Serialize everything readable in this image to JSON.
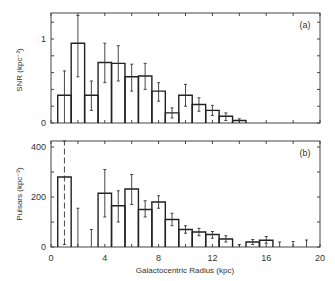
{
  "chart_data": [
    {
      "type": "bar",
      "panel_label": "(a)",
      "title": "",
      "xlabel": "Galactocentric Radius (kpc)",
      "ylabel": "SNR (kpc⁻²)",
      "xlim": [
        0,
        20
      ],
      "ylim": [
        0,
        1.3
      ],
      "yticks": [
        0,
        1
      ],
      "ytick_labels": [
        "0",
        "1"
      ],
      "bin_width": 1,
      "bin_centers": [
        1,
        2,
        3,
        4,
        5,
        6,
        7,
        8,
        9,
        10,
        11,
        12,
        13,
        14
      ],
      "values": [
        0.33,
        0.95,
        0.33,
        0.72,
        0.71,
        0.55,
        0.56,
        0.38,
        0.12,
        0.33,
        0.22,
        0.15,
        0.08,
        0.03
      ],
      "err_low": [
        0.0,
        0.55,
        0.15,
        0.48,
        0.5,
        0.38,
        0.4,
        0.26,
        0.06,
        0.2,
        0.14,
        0.09,
        0.03,
        0.0
      ],
      "err_high": [
        0.62,
        1.28,
        0.5,
        0.95,
        0.92,
        0.7,
        0.71,
        0.48,
        0.18,
        0.46,
        0.3,
        0.21,
        0.12,
        0.05
      ],
      "grid": false
    },
    {
      "type": "bar",
      "panel_label": "(b)",
      "title": "",
      "xlabel": "Galactocentric Radius (kpc)",
      "ylabel": "Pulsars (kpc⁻²)",
      "xlim": [
        0,
        20
      ],
      "ylim": [
        0,
        430
      ],
      "xticks": [
        0,
        4,
        8,
        12,
        16,
        20
      ],
      "xtick_labels": [
        "0",
        "4",
        "8",
        "12",
        "16",
        "20"
      ],
      "yticks": [
        0,
        200,
        400
      ],
      "ytick_labels": [
        "0",
        "200",
        "400"
      ],
      "bin_width": 1,
      "bin_centers": [
        1,
        2,
        3,
        4,
        5,
        6,
        7,
        8,
        9,
        10,
        11,
        12,
        13,
        14,
        15,
        16,
        17,
        18,
        19
      ],
      "values": [
        280,
        0,
        0,
        215,
        165,
        232,
        150,
        180,
        110,
        70,
        60,
        50,
        32,
        0,
        20,
        27,
        0,
        0,
        0
      ],
      "err_low": [
        10,
        0,
        0,
        120,
        100,
        170,
        120,
        155,
        85,
        55,
        45,
        35,
        20,
        0,
        10,
        15,
        0,
        0,
        0
      ],
      "err_high": [
        430,
        155,
        70,
        310,
        225,
        290,
        185,
        205,
        135,
        85,
        75,
        62,
        45,
        10,
        30,
        42,
        20,
        22,
        28
      ],
      "upper_limit_dashed_bin": 1,
      "grid": false
    }
  ],
  "figure": {
    "xlabel": "Galactocentric Radius (kpc)",
    "panel_a_label": "(a)",
    "panel_b_label": "(b)",
    "panel_a_ylabel": "SNR (kpc⁻²)",
    "panel_b_ylabel": "Pulsars (kpc⁻²)"
  }
}
